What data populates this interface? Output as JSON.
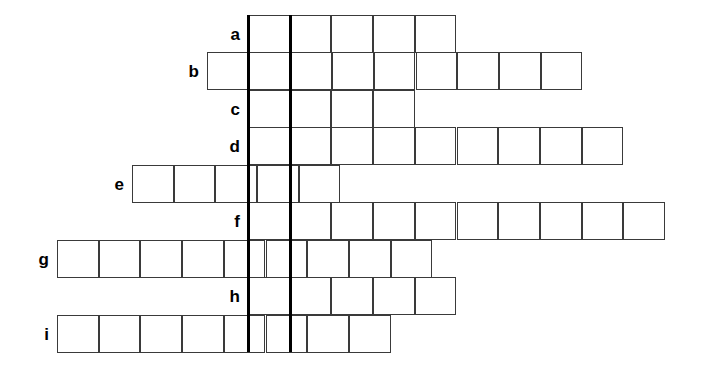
{
  "puzzle": {
    "type": "crossword-style-letter-grid",
    "cell_width": 41.7,
    "cell_height": 37.5,
    "grid_top": 15,
    "row_count": 9,
    "bold_divider_color": "#000000",
    "cell_border_color": "#3a3a3a",
    "background_color": "#ffffff",
    "bold_dividers": [
      {
        "name": "bold-divider-left",
        "x": 248,
        "top": 15,
        "bottom": 352
      },
      {
        "name": "bold-divider-right",
        "x": 290,
        "top": 15,
        "bottom": 352
      }
    ],
    "rows": [
      {
        "label": "a",
        "start_x": 248,
        "cells": 5,
        "end_x": 457,
        "top": 15
      },
      {
        "label": "b",
        "start_x": 207,
        "cells": 9,
        "end_x": 582,
        "top": 52
      },
      {
        "label": "c",
        "start_x": 248,
        "cells": 4,
        "end_x": 415,
        "top": 90
      },
      {
        "label": "d",
        "start_x": 248,
        "cells": 9,
        "end_x": 623,
        "top": 127
      },
      {
        "label": "e",
        "start_x": 132,
        "cells": 5,
        "end_x": 340,
        "top": 165
      },
      {
        "label": "f",
        "start_x": 248,
        "cells": 10,
        "end_x": 665,
        "top": 202
      },
      {
        "label": "g",
        "start_x": 57,
        "cells": 9,
        "end_x": 432,
        "top": 240
      },
      {
        "label": "h",
        "start_x": 248,
        "cells": 5,
        "end_x": 457,
        "top": 277
      },
      {
        "label": "i",
        "start_x": 57,
        "cells": 8,
        "end_x": 390,
        "top": 315
      }
    ]
  }
}
